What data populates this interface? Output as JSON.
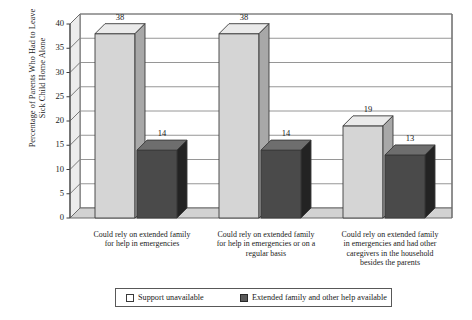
{
  "chart_data": {
    "type": "bar",
    "title": "",
    "subtitle": "",
    "xlabel": "",
    "ylabel_lines": [
      "Percentage of Parents Who Had to Leave",
      "Sick Child Home Alone"
    ],
    "ylabel": "Percentage of Parents Who Had to Leave Sick Child Home Alone",
    "ylim": [
      0,
      40
    ],
    "ytick_step": 5,
    "yticks": [
      "0",
      "5",
      "10",
      "15",
      "20",
      "25",
      "30",
      "35",
      "40"
    ],
    "grid": true,
    "grid_axis": "y",
    "legend_position": "bottom",
    "three_d": true,
    "categories": [
      "Could rely on extended family for help in emergencies",
      "Could rely on extended family for help in emergencies or on a regular basis",
      "Could rely on extended family in emergencies and had other caregivers in the household besides the parents"
    ],
    "category_label_lines": [
      [
        "Could rely on extended family",
        "for help in emergencies"
      ],
      [
        "Could rely on extended family",
        "for help in emergencies or on a",
        "regular basis"
      ],
      [
        "Could rely on extended family",
        "in emergencies and had other",
        "caregivers in the household",
        "besides the parents"
      ]
    ],
    "series": [
      {
        "name": "Support unavailable",
        "color": "#d5d5d5",
        "side_color": "#a8a8a8",
        "top_color": "#eaeaea",
        "values": [
          38,
          38,
          19
        ],
        "value_labels": [
          "38",
          "38",
          "19"
        ]
      },
      {
        "name": "Extended family and other help available",
        "color": "#4a4a4a",
        "side_color": "#232323",
        "top_color": "#6e6e6e",
        "values": [
          14,
          14,
          13
        ],
        "value_labels": [
          "14",
          "14",
          "13"
        ]
      }
    ],
    "legend": [
      {
        "label": "Support unavailable",
        "color": "#ffffff",
        "border": "#3a3a3a"
      },
      {
        "label": "Extended family and other help available",
        "color": "#5a5a5a",
        "border": "#2a2a2a"
      }
    ],
    "axis_color": "#6b6b6b",
    "grid_color": "#8a8a8a",
    "floor_color": "#d2d2d2",
    "wall_color": "#ffffff"
  }
}
